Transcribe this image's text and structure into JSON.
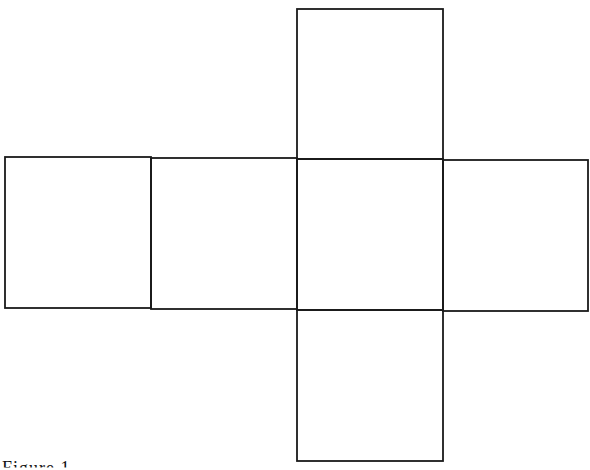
{
  "diagram": {
    "type": "cube-net",
    "stroke_color": "#1a1a1a",
    "background": "#ffffff",
    "faces": [
      {
        "id": "top",
        "x": 297,
        "y": 9,
        "w": 146,
        "h": 150
      },
      {
        "id": "row-1",
        "x": 5,
        "y": 157,
        "w": 146,
        "h": 151
      },
      {
        "id": "row-2",
        "x": 151,
        "y": 158,
        "w": 146,
        "h": 151
      },
      {
        "id": "row-3-center",
        "x": 297,
        "y": 159,
        "w": 146,
        "h": 151
      },
      {
        "id": "row-4",
        "x": 443,
        "y": 160,
        "w": 145,
        "h": 151
      },
      {
        "id": "bottom",
        "x": 297,
        "y": 310,
        "w": 146,
        "h": 151
      }
    ]
  },
  "caption": {
    "partial_text": "Figure 1"
  }
}
